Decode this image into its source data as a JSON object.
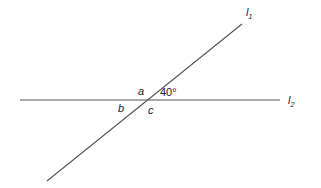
{
  "diagram": {
    "lines": [
      {
        "id": "l1",
        "name": "l",
        "subscript": "1",
        "kind": "transversal"
      },
      {
        "id": "l2",
        "name": "l",
        "subscript": "2",
        "kind": "horizontal"
      }
    ],
    "angles": {
      "given": "40°",
      "a": "a",
      "b": "b",
      "c": "c"
    },
    "colors": {
      "line": "#555555",
      "text": "#222222"
    }
  }
}
